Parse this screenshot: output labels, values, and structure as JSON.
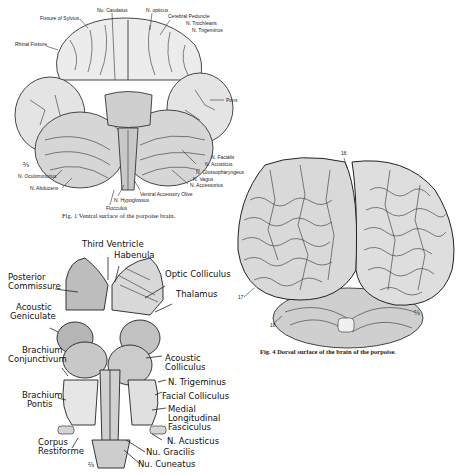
{
  "figures": [
    {
      "id": "fig1",
      "caption": "Fig. 1   Ventral surface of the porpoise brain.",
      "labels": {
        "fissure_sylvius": "Fissure of Sylvius",
        "nu_caudatus": "Nu. Caudatus",
        "n_opticus": "N. opticus",
        "cerebral_peduncle": "Cerebral Peduncle",
        "n_trochlearis": "N. Trochlearis",
        "n_trigeminus": "N. Trigeminus",
        "rhinal_fissure": "Rhinal Fissure",
        "pons": "Pons",
        "n_facialis": "N. Facialis",
        "n_acusticus": "N. Acusticus",
        "n_glossopharyngeus": "N. Glossopharyngeus",
        "n_vagus": "N. Vagus",
        "n_accessorius": "N. Accessorius",
        "n_oculomotorius": "N. Oculomotorius",
        "n_abducens": "N. Abducens",
        "ventral_accessory_olive": "Ventral Accessory Olive",
        "n_hypoglossus": "N. Hypoglossus",
        "flocculus": "Flocculus",
        "scale_mark": "⅔"
      }
    },
    {
      "id": "fig4",
      "caption": "Fig. 4   Dorsal surface of the brain of the porpoise.",
      "labels": {
        "num_16": "16",
        "num_17": "17",
        "num_18": "18",
        "scale_mark": "⅔"
      }
    },
    {
      "id": "fig_brainstem",
      "labels": {
        "third_ventricle": "Third Ventricle",
        "habenula": "Habenula",
        "posterior_commissure_1": "Posterior",
        "posterior_commissure_2": "Commissure",
        "optic_colliculus": "Optic Colliculus",
        "thalamus": "Thalamus",
        "acoustic_geniculate_1": "Acoustic",
        "acoustic_geniculate_2": "Geniculate",
        "acoustic_colliculus_1": "Acoustic",
        "acoustic_colliculus_2": "Colliculus",
        "brachium_conjunctivum_1": "Brachium",
        "brachium_conjunctivum_2": "Conjunctivum",
        "n_trigeminus": "N. Trigeminus",
        "brachium_pontis_1": "Brachium",
        "brachium_pontis_2": "Pontis",
        "facial_colliculus": "Facial Colliculus",
        "medial_longitudinal_1": "Medial",
        "medial_longitudinal_2": "Longitudinal",
        "medial_longitudinal_3": "Fasciculus",
        "n_acusticus": "N. Acusticus",
        "corpus_restiforme_1": "Corpus",
        "corpus_restiforme_2": "Restiforme",
        "nu_gracilis": "Nu. Gracilis",
        "nu_cuneatus": "Nu. Cuneatus",
        "scale_mark": "⅔"
      }
    }
  ]
}
